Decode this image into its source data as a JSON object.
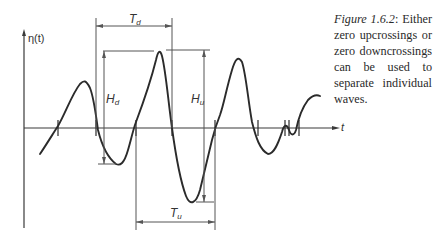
{
  "figure": {
    "axis_y_label": "η(t)",
    "axis_x_label": "t",
    "annotations": {
      "T_d": "T",
      "T_d_sub": "d",
      "T_u": "T",
      "T_u_sub": "u",
      "H_d": "H",
      "H_d_sub": "d",
      "H_u": "H",
      "H_u_sub": "u"
    },
    "colors": {
      "wave": "#2b2b2b",
      "axes": "#3a3a3a",
      "dimension_lines": "#555555"
    }
  },
  "caption": {
    "label": "Figure 1.6.2",
    "text": ": Either zero upcrossings or zero downcrossings can be used to separate individual waves."
  }
}
